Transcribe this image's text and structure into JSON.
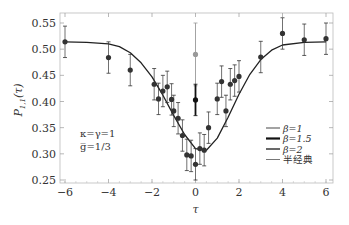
{
  "chart_data": {
    "type": "scatter",
    "title": "",
    "xlabel": "τ",
    "ylabel": "P1,1(τ)",
    "xlim": [
      -6,
      6
    ],
    "ylim": [
      0.25,
      0.55
    ],
    "x_ticks": [
      "-6",
      "-4",
      "-2",
      "0",
      "2",
      "4",
      "6"
    ],
    "y_ticks": [
      "0.25",
      "0.30",
      "0.35",
      "0.40",
      "0.45",
      "0.50",
      "0.55"
    ],
    "grid": false,
    "annotations": [
      "κ=γ=1",
      "g̅=1/3"
    ],
    "legend_position": "lower-right",
    "legend": [
      {
        "label": "β=1",
        "color": "#666666",
        "width": 1.2
      },
      {
        "label": "β=1.5",
        "color": "#111111",
        "width": 2.2
      },
      {
        "label": "β=2",
        "color": "#444444",
        "width": 1.6
      },
      {
        "label": "半经典",
        "color": "#777777",
        "width": 1.0
      }
    ],
    "series": [
      {
        "name": "theory curve",
        "type": "line",
        "x": [
          -6,
          -5,
          -4,
          -3.5,
          -3,
          -2.5,
          -2,
          -1.5,
          -1,
          -0.5,
          0,
          0.5,
          1,
          1.5,
          2,
          2.5,
          3,
          3.5,
          4,
          5,
          6
        ],
        "y": [
          0.514,
          0.513,
          0.51,
          0.505,
          0.493,
          0.474,
          0.447,
          0.412,
          0.373,
          0.337,
          0.31,
          0.307,
          0.33,
          0.37,
          0.414,
          0.452,
          0.48,
          0.498,
          0.508,
          0.513,
          0.514
        ]
      },
      {
        "name": "measured (black)",
        "type": "errorbar",
        "points": [
          {
            "x": -6,
            "y": 0.514,
            "err": 0.03
          },
          {
            "x": -4,
            "y": 0.484,
            "err": 0.03
          },
          {
            "x": -3,
            "y": 0.46,
            "err": 0.03
          },
          {
            "x": -1.9,
            "y": 0.433,
            "err": 0.03
          },
          {
            "x": -1.7,
            "y": 0.405,
            "err": 0.03
          },
          {
            "x": -1.5,
            "y": 0.42,
            "err": 0.03
          },
          {
            "x": -1.3,
            "y": 0.428,
            "err": 0.03
          },
          {
            "x": -1.1,
            "y": 0.404,
            "err": 0.03
          },
          {
            "x": -1.0,
            "y": 0.382,
            "err": 0.03
          },
          {
            "x": -0.8,
            "y": 0.368,
            "err": 0.03
          },
          {
            "x": -0.6,
            "y": 0.335,
            "err": 0.03
          },
          {
            "x": -0.4,
            "y": 0.298,
            "err": 0.03
          },
          {
            "x": -0.2,
            "y": 0.296,
            "err": 0.03
          },
          {
            "x": 0,
            "y": 0.403,
            "err": 0.03
          },
          {
            "x": 0,
            "y": 0.28,
            "err": 0.03
          },
          {
            "x": 0.2,
            "y": 0.31,
            "err": 0.03
          },
          {
            "x": 0.4,
            "y": 0.307,
            "err": 0.03
          },
          {
            "x": 0.6,
            "y": 0.35,
            "err": 0.03
          },
          {
            "x": 1.0,
            "y": 0.405,
            "err": 0.03
          },
          {
            "x": 1.2,
            "y": 0.438,
            "err": 0.03
          },
          {
            "x": 1.4,
            "y": 0.382,
            "err": 0.03
          },
          {
            "x": 1.6,
            "y": 0.433,
            "err": 0.03
          },
          {
            "x": 1.8,
            "y": 0.44,
            "err": 0.03
          },
          {
            "x": 2.0,
            "y": 0.448,
            "err": 0.03
          },
          {
            "x": 3.0,
            "y": 0.485,
            "err": 0.03
          },
          {
            "x": 4.0,
            "y": 0.53,
            "err": 0.03
          },
          {
            "x": 5.0,
            "y": 0.518,
            "err": 0.03
          },
          {
            "x": 6.0,
            "y": 0.52,
            "err": 0.03
          }
        ]
      },
      {
        "name": "measured (gray)",
        "type": "errorbar",
        "points": [
          {
            "x": 0,
            "y": 0.49,
            "err": 0.06
          }
        ]
      }
    ]
  }
}
